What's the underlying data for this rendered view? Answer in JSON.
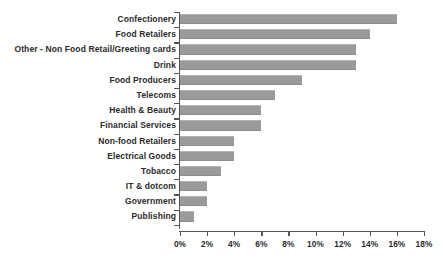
{
  "chart_data": {
    "type": "bar",
    "orientation": "horizontal",
    "title": "",
    "subtitle": "",
    "xlabel": "",
    "ylabel": "",
    "xlim": [
      0,
      18
    ],
    "xtick_step": 2,
    "xtick_labels": [
      "0%",
      "2%",
      "4%",
      "6%",
      "8%",
      "10%",
      "12%",
      "14%",
      "16%",
      "18%"
    ],
    "xtick_values": [
      0,
      2,
      4,
      6,
      8,
      10,
      12,
      14,
      16,
      18
    ],
    "grid": false,
    "legend": false,
    "legend_position": "none",
    "bar_color": "#9a9a9a",
    "axis_color": "#555555",
    "label_color": "#2b2b2b",
    "background_color": "#ffffff",
    "value_unit": "%",
    "categories": [
      "Confectionery",
      "Food Retailers",
      "Other - Non Food Retail/Greeting cards",
      "Drink",
      "Food Producers",
      "Telecoms",
      "Health & Beauty",
      "Financial Services",
      "Non-food Retailers",
      "Electrical Goods",
      "Tobacco",
      "IT & dotcom",
      "Government",
      "Publishing"
    ],
    "values": [
      16,
      14,
      13,
      13,
      9,
      7,
      6,
      6,
      4,
      4,
      3,
      2,
      2,
      1
    ]
  }
}
